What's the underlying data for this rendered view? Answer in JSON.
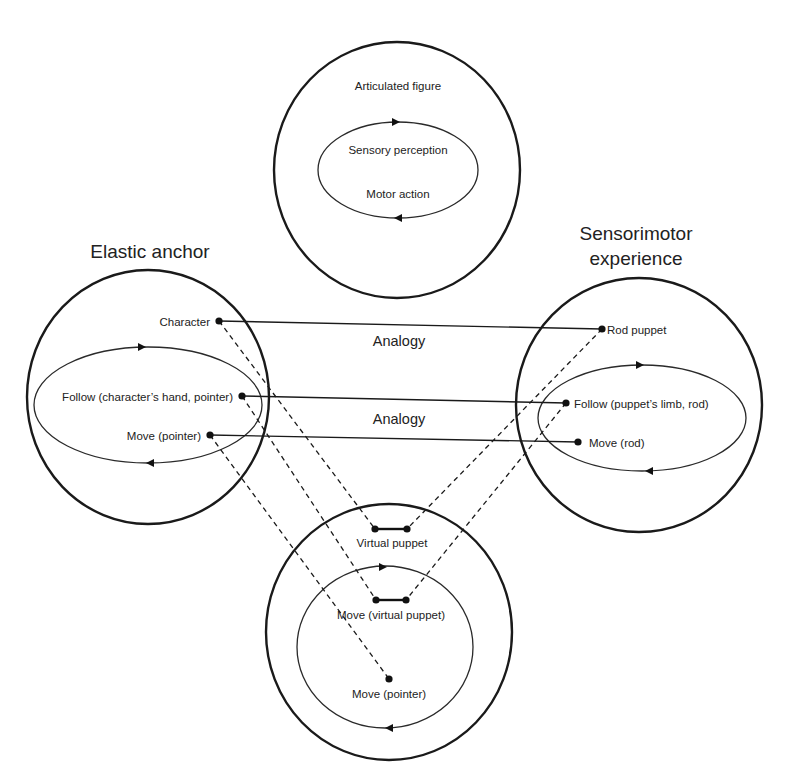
{
  "diagram": {
    "top_circle": {
      "title": "Articulated figure",
      "inner_top": "Sensory perception",
      "inner_bottom": "Motor action"
    },
    "left_circle": {
      "heading": "Elastic anchor",
      "character": "Character",
      "follow": "Follow (character’s hand, pointer)",
      "move": "Move (pointer)"
    },
    "right_circle": {
      "heading_line1": "Sensorimotor",
      "heading_line2": "experience",
      "rod_puppet": "Rod puppet",
      "follow": "Follow (puppet’s limb, rod)",
      "move": "Move (rod)"
    },
    "bottom_circle": {
      "virtual_puppet": "Virtual puppet",
      "move_virtual_puppet": "Move (virtual puppet)",
      "move_pointer": "Move (pointer)"
    },
    "analogy_labels": [
      "Analogy",
      "Analogy"
    ],
    "colors": {
      "stroke": "#1a1a1a",
      "text": "#222222",
      "background": "#ffffff"
    }
  }
}
